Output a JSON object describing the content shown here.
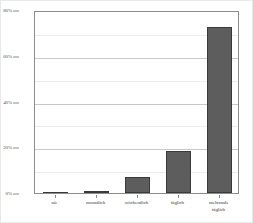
{
  "chart_data": {
    "type": "bar",
    "title": "",
    "subtitle": "",
    "xlabel": "",
    "ylabel": "",
    "categories": [
      "nie",
      "monatlich",
      "wöchentlich",
      "täglich",
      "mehrmals\ntäglich"
    ],
    "values": [
      0.2,
      1.0,
      7.0,
      18.5,
      72.5
    ],
    "series": [
      {
        "name": "Häufigkeit",
        "values": [
          0.2,
          1.0,
          7.0,
          18.5,
          72.5
        ]
      }
    ],
    "ylim": [
      0,
      80
    ],
    "xlim_categories": 5,
    "y_ticks": [
      0,
      20,
      40,
      60,
      80
    ],
    "y_tick_labels": [
      "0%",
      "20%",
      "40%",
      "60%",
      "80%"
    ],
    "y_minor_ticks": [
      10,
      30,
      50,
      70
    ],
    "grid": true,
    "grid_axis": "y",
    "legend": false,
    "legend_position": "none",
    "annotations": [],
    "bar_color": "#5d5d5d",
    "bar_edge_color": "#3a3a3a",
    "axis_color": "#8d8d8d",
    "gridline_color": "#c8c8c8",
    "minor_gridline_color": "#ededed",
    "background_color": "#ffffff",
    "tick_label_color": "#3b3b3b"
  },
  "axes": {
    "y_ticks": [
      {
        "label": "80%",
        "value": 80
      },
      {
        "label": "60%",
        "value": 60
      },
      {
        "label": "40%",
        "value": 40
      },
      {
        "label": "20%",
        "value": 20
      },
      {
        "label": "0%",
        "value": 0
      }
    ],
    "x_ticks": [
      {
        "label": "nie"
      },
      {
        "label": "monatlich"
      },
      {
        "label": "wöchentlich"
      },
      {
        "label": "täglich"
      },
      {
        "label": "mehrmals\ntäglich"
      }
    ]
  }
}
